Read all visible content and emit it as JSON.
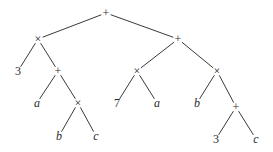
{
  "diagram": {
    "type": "expression-tree",
    "nodes": [
      {
        "id": "n0",
        "label": "+",
        "kind": "op",
        "x": 106,
        "y": 13
      },
      {
        "id": "n1",
        "label": "×",
        "kind": "op",
        "x": 38,
        "y": 39
      },
      {
        "id": "n2",
        "label": "3",
        "kind": "num",
        "x": 18,
        "y": 71
      },
      {
        "id": "n3",
        "label": "+",
        "kind": "op",
        "x": 58,
        "y": 71
      },
      {
        "id": "n4",
        "label": "a",
        "kind": "var",
        "x": 37,
        "y": 103
      },
      {
        "id": "n5",
        "label": "×",
        "kind": "op",
        "x": 78,
        "y": 103
      },
      {
        "id": "n6",
        "label": "b",
        "kind": "var",
        "x": 59,
        "y": 136
      },
      {
        "id": "n7",
        "label": "c",
        "kind": "var",
        "x": 96,
        "y": 136
      },
      {
        "id": "n8",
        "label": "+",
        "kind": "op",
        "x": 178,
        "y": 39
      },
      {
        "id": "n9",
        "label": "×",
        "kind": "op",
        "x": 137,
        "y": 71
      },
      {
        "id": "n10",
        "label": "7",
        "kind": "num",
        "x": 117,
        "y": 103
      },
      {
        "id": "n11",
        "label": "a",
        "kind": "var",
        "x": 157,
        "y": 103
      },
      {
        "id": "n12",
        "label": "×",
        "kind": "op",
        "x": 217,
        "y": 71
      },
      {
        "id": "n13",
        "label": "b",
        "kind": "var",
        "x": 197,
        "y": 103
      },
      {
        "id": "n14",
        "label": "+",
        "kind": "op",
        "x": 236,
        "y": 107
      },
      {
        "id": "n15",
        "label": "3",
        "kind": "num",
        "x": 216,
        "y": 139
      },
      {
        "id": "n16",
        "label": "c",
        "kind": "var",
        "x": 256,
        "y": 139
      }
    ],
    "edges": [
      [
        "n0",
        "n1"
      ],
      [
        "n0",
        "n8"
      ],
      [
        "n1",
        "n2"
      ],
      [
        "n1",
        "n3"
      ],
      [
        "n3",
        "n4"
      ],
      [
        "n3",
        "n5"
      ],
      [
        "n5",
        "n6"
      ],
      [
        "n5",
        "n7"
      ],
      [
        "n8",
        "n9"
      ],
      [
        "n8",
        "n12"
      ],
      [
        "n9",
        "n10"
      ],
      [
        "n9",
        "n11"
      ],
      [
        "n12",
        "n13"
      ],
      [
        "n12",
        "n14"
      ],
      [
        "n14",
        "n15"
      ],
      [
        "n14",
        "n16"
      ]
    ],
    "colors": {
      "line": "#3a3a3a",
      "text": "#2a2a2a",
      "background": "#ffffff"
    }
  }
}
